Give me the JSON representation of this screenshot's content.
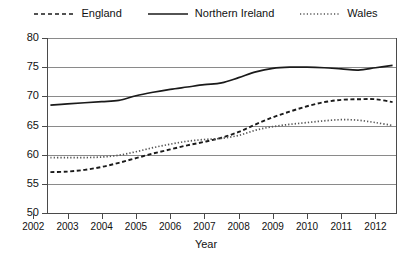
{
  "legend": {
    "items": [
      {
        "label": "England",
        "style": "dashed",
        "color": "#1a1a1a"
      },
      {
        "label": "Northern Ireland",
        "style": "solid",
        "color": "#1a1a1a"
      },
      {
        "label": "Wales",
        "style": "dotted",
        "color": "#555555"
      }
    ]
  },
  "axes": {
    "x_title": "Year",
    "y_title": "",
    "x_ticks": [
      "2002",
      "2003",
      "2004",
      "2005",
      "2006",
      "2007",
      "2008",
      "2009",
      "2010",
      "2011",
      "2012"
    ],
    "y_ticks": [
      "80",
      "75",
      "70",
      "65",
      "60",
      "55",
      "50"
    ]
  },
  "chart_data": {
    "type": "line",
    "title": "",
    "subtitle": "",
    "xlabel": "Year",
    "ylabel": "",
    "xlim": [
      2002.4,
      2012.6
    ],
    "ylim": [
      50,
      80
    ],
    "grid": true,
    "legend_position": "top-center",
    "x": [
      2002.5,
      2003,
      2003.5,
      2004,
      2004.5,
      2005,
      2005.5,
      2006,
      2006.5,
      2007,
      2007.5,
      2008,
      2008.5,
      2009,
      2009.5,
      2010,
      2010.5,
      2011,
      2011.5,
      2012,
      2012.5
    ],
    "series": [
      {
        "name": "England",
        "style": "dashed",
        "color": "#1a1a1a",
        "values": [
          57.0,
          57.1,
          57.4,
          57.9,
          58.6,
          59.4,
          60.2,
          60.9,
          61.6,
          62.2,
          62.9,
          63.9,
          65.2,
          66.4,
          67.4,
          68.3,
          69.0,
          69.4,
          69.5,
          69.5,
          69.0
        ]
      },
      {
        "name": "Northern Ireland",
        "style": "solid",
        "color": "#1a1a1a",
        "values": [
          68.5,
          68.7,
          68.9,
          69.1,
          69.3,
          70.1,
          70.7,
          71.2,
          71.6,
          72.0,
          72.3,
          73.2,
          74.2,
          74.8,
          75.0,
          75.0,
          74.9,
          74.7,
          74.5,
          74.9,
          75.3
        ]
      },
      {
        "name": "Wales",
        "style": "dotted",
        "color": "#555555",
        "values": [
          59.5,
          59.5,
          59.5,
          59.6,
          59.9,
          60.5,
          61.2,
          61.8,
          62.3,
          62.6,
          62.8,
          63.3,
          64.2,
          64.8,
          65.2,
          65.5,
          65.8,
          66.0,
          65.9,
          65.5,
          65.0
        ]
      }
    ]
  }
}
